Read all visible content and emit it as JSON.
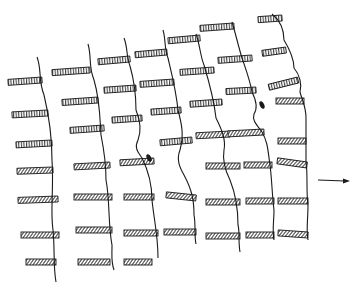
{
  "figure": {
    "stroke_color": "#1a1a1a",
    "background": "#ffffff",
    "arrow": {
      "x1": 318,
      "y1": 180,
      "x2": 350,
      "y2": 181,
      "direction": "right"
    },
    "columns": [
      {
        "line": "M37,57 C42,70 38,80 44,95 C50,120 52,140 52,160 C54,190 50,210 53,230 C55,250 53,265 56,282",
        "bars": [
          {
            "x": 8,
            "y": 80,
            "w": 34,
            "r": -4,
            "hatch": "v"
          },
          {
            "x": 12,
            "y": 113,
            "w": 36,
            "r": -3,
            "hatch": "v"
          },
          {
            "x": 16,
            "y": 143,
            "w": 36,
            "r": -3,
            "hatch": "v"
          },
          {
            "x": 17,
            "y": 170,
            "w": 36,
            "r": -2,
            "hatch": "d"
          },
          {
            "x": 18,
            "y": 199,
            "w": 40,
            "r": -2,
            "hatch": "d"
          },
          {
            "x": 21,
            "y": 235,
            "w": 38,
            "r": 0,
            "hatch": "d"
          },
          {
            "x": 26,
            "y": 262,
            "w": 30,
            "r": 0,
            "hatch": "d"
          }
        ]
      },
      {
        "line": "M88,44 C92,58 88,65 94,80 C100,100 100,120 101,135 C104,150 106,165 106,180 C110,200 108,225 112,245 C112,258 111,262 114,270",
        "bars": [
          {
            "x": 52,
            "y": 70,
            "w": 38,
            "r": -4,
            "hatch": "v"
          },
          {
            "x": 62,
            "y": 100,
            "w": 36,
            "r": -4,
            "hatch": "v"
          },
          {
            "x": 70,
            "y": 128,
            "w": 34,
            "r": -4,
            "hatch": "v"
          },
          {
            "x": 74,
            "y": 165,
            "w": 36,
            "r": -3,
            "hatch": "d"
          },
          {
            "x": 74,
            "y": 197,
            "w": 38,
            "r": 0,
            "hatch": "d"
          },
          {
            "x": 76,
            "y": 230,
            "w": 36,
            "r": 0,
            "hatch": "d"
          },
          {
            "x": 78,
            "y": 262,
            "w": 32,
            "r": 0,
            "hatch": "d"
          }
        ]
      },
      {
        "line": "M124,38 C128,48 126,56 130,66 C134,80 136,95 136,110 C140,120 142,130 138,140 C134,148 138,152 142,158 C148,170 152,185 152,200 C154,220 158,235 158,258",
        "bars": [
          {
            "x": 98,
            "y": 59,
            "w": 32,
            "r": -5,
            "hatch": "v"
          },
          {
            "x": 104,
            "y": 88,
            "w": 32,
            "r": -4,
            "hatch": "v"
          },
          {
            "x": 112,
            "y": 118,
            "w": 30,
            "r": -4,
            "hatch": "v"
          },
          {
            "x": 120,
            "y": 161,
            "w": 34,
            "r": -3,
            "hatch": "d"
          },
          {
            "x": 124,
            "y": 197,
            "w": 30,
            "r": 0,
            "hatch": "d"
          },
          {
            "x": 124,
            "y": 233,
            "w": 34,
            "r": 0,
            "hatch": "d"
          },
          {
            "x": 124,
            "y": 262,
            "w": 28,
            "r": 0,
            "hatch": "d"
          }
        ]
      },
      {
        "line": "M163,30 C166,40 164,48 168,58 C172,75 176,90 178,110 C182,125 184,135 180,150 C176,160 180,168 184,175 C192,190 194,200 194,215 C196,225 194,235 196,244",
        "bars": [
          {
            "x": 135,
            "y": 52,
            "w": 32,
            "r": -5,
            "hatch": "v"
          },
          {
            "x": 140,
            "y": 82,
            "w": 34,
            "r": -4,
            "hatch": "v"
          },
          {
            "x": 151,
            "y": 110,
            "w": 30,
            "r": -4,
            "hatch": "v"
          },
          {
            "x": 160,
            "y": 140,
            "w": 32,
            "r": -5,
            "hatch": "v"
          },
          {
            "x": 166,
            "y": 198,
            "w": 30,
            "r": 6,
            "hatch": "d"
          },
          {
            "x": 164,
            "y": 232,
            "w": 32,
            "r": 0,
            "hatch": "d"
          }
        ]
      },
      {
        "line": "M196,34 C200,45 200,55 204,65 C210,85 214,100 216,118 C222,130 226,140 224,150 C222,162 226,172 230,180 C236,195 238,210 238,225 C240,232 238,240 240,252",
        "bars": [
          {
            "x": 168,
            "y": 38,
            "w": 32,
            "r": -5,
            "hatch": "v"
          },
          {
            "x": 180,
            "y": 70,
            "w": 34,
            "r": -4,
            "hatch": "v"
          },
          {
            "x": 190,
            "y": 102,
            "w": 32,
            "r": -4,
            "hatch": "v"
          },
          {
            "x": 196,
            "y": 134,
            "w": 34,
            "r": -3,
            "hatch": "d"
          },
          {
            "x": 206,
            "y": 166,
            "w": 34,
            "r": 0,
            "hatch": "d"
          },
          {
            "x": 206,
            "y": 202,
            "w": 34,
            "r": 0,
            "hatch": "d"
          },
          {
            "x": 206,
            "y": 236,
            "w": 34,
            "r": 0,
            "hatch": "d"
          }
        ]
      },
      {
        "line": "M232,22 C236,35 238,45 242,58 C246,70 250,80 252,92 C256,100 258,108 254,114 C252,120 256,124 262,132 C268,142 268,152 270,165 C272,180 272,195 274,210 C274,222 272,230 274,240",
        "bars": [
          {
            "x": 200,
            "y": 26,
            "w": 34,
            "r": -4,
            "hatch": "v"
          },
          {
            "x": 218,
            "y": 58,
            "w": 34,
            "r": -4,
            "hatch": "v"
          },
          {
            "x": 226,
            "y": 90,
            "w": 30,
            "r": -3,
            "hatch": "v"
          },
          {
            "x": 228,
            "y": 132,
            "w": 36,
            "r": -3,
            "hatch": "d"
          },
          {
            "x": 244,
            "y": 165,
            "w": 28,
            "r": 0,
            "hatch": "d"
          },
          {
            "x": 246,
            "y": 201,
            "w": 28,
            "r": 0,
            "hatch": "d"
          },
          {
            "x": 246,
            "y": 235,
            "w": 28,
            "r": 0,
            "hatch": "d"
          }
        ]
      },
      {
        "line": "M272,14 C282,22 284,32 284,40 C290,50 294,60 294,68 C300,75 302,85 300,92 C302,100 306,106 306,118 C306,135 306,150 306,162 C308,175 306,190 308,205 C308,220 306,230 308,240",
        "bars": [
          {
            "x": 258,
            "y": 18,
            "w": 24,
            "r": -4,
            "hatch": "v"
          },
          {
            "x": 262,
            "y": 50,
            "w": 24,
            "r": -8,
            "hatch": "v"
          },
          {
            "x": 268,
            "y": 80,
            "w": 30,
            "r": -14,
            "hatch": "v"
          },
          {
            "x": 276,
            "y": 101,
            "w": 28,
            "r": 0,
            "hatch": "d"
          },
          {
            "x": 278,
            "y": 141,
            "w": 28,
            "r": 0,
            "hatch": "d"
          },
          {
            "x": 277,
            "y": 165,
            "w": 30,
            "r": 8,
            "hatch": "d"
          },
          {
            "x": 278,
            "y": 201,
            "w": 30,
            "r": 0,
            "hatch": "d"
          },
          {
            "x": 278,
            "y": 235,
            "w": 30,
            "r": 4,
            "hatch": "d"
          }
        ]
      }
    ],
    "blobs": [
      {
        "x": 149,
        "y": 158
      },
      {
        "x": 262,
        "y": 105
      }
    ]
  }
}
